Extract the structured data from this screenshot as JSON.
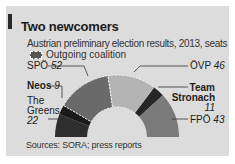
{
  "chart_data": {
    "type": "pie",
    "subtype": "hemicycle",
    "title": "Two newcomers",
    "subtitle": "Austrian preliminary election results, 2013, seats",
    "legend": [
      {
        "label": "Outgoing coalition",
        "style": "dashed-outline"
      }
    ],
    "total_seats": 183,
    "series": [
      {
        "name": "The Greens",
        "value": 22,
        "color": "#2e2e2e",
        "coalition": false
      },
      {
        "name": "Neos",
        "value": 9,
        "color": "#1a1a1a",
        "coalition": false
      },
      {
        "name": "SPÖ",
        "value": 52,
        "color": "#6a6a6a",
        "coalition": true
      },
      {
        "name": "ÖVP",
        "value": 46,
        "color": "#b4b4b4",
        "coalition": true
      },
      {
        "name": "Team Stronach",
        "value": 11,
        "color": "#262626",
        "coalition": false
      },
      {
        "name": "FPÖ",
        "value": 43,
        "color": "#7a7a7a",
        "coalition": false
      }
    ],
    "source": "Sources: SORA; press reports"
  },
  "labels": {
    "spo": {
      "name": "SPÖ",
      "value": "52"
    },
    "ovp": {
      "name": "ÖVP",
      "value": "46"
    },
    "neos": {
      "name": "Neos",
      "value": "9"
    },
    "greens_line1": "The",
    "greens_line2": "Greens",
    "greens_value": "22",
    "stronach_line1": "Team",
    "stronach_line2": "Stronach",
    "stronach_value": "11",
    "fpo": {
      "name": "FPÖ",
      "value": "43"
    }
  }
}
